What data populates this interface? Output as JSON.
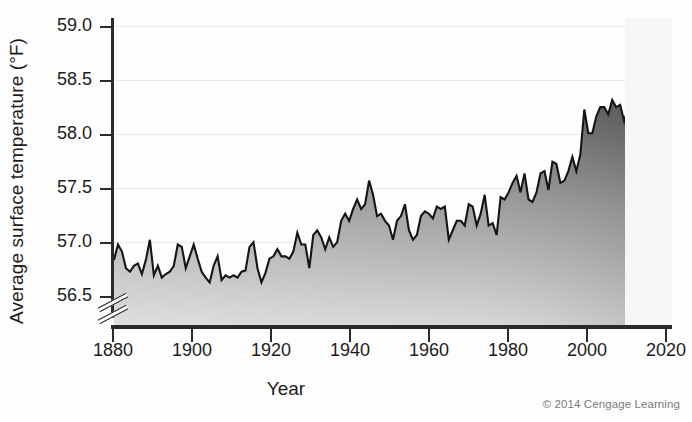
{
  "chart_data": {
    "type": "area",
    "title": "",
    "xlabel": "Year",
    "ylabel": "Average surface temperature (°F)",
    "xlim": [
      1880,
      2020
    ],
    "ylim": [
      56.5,
      59.0
    ],
    "axis_break": true,
    "axis_break_note": "y-axis broken below 56.5",
    "grid": true,
    "legend": null,
    "credit": "© 2014 Cengage Learning",
    "xticks": [
      1880,
      1900,
      1920,
      1940,
      1960,
      1980,
      2000,
      2020
    ],
    "xtick_labels": [
      "1880",
      "1900",
      "1920",
      "1940",
      "1960",
      "1980",
      "2000",
      "2020"
    ],
    "yticks": [
      56.5,
      57.0,
      57.5,
      58.0,
      58.5,
      59.0
    ],
    "ytick_labels": [
      "56.5",
      "57.0",
      "57.5",
      "58.0",
      "58.5",
      "59.0"
    ],
    "series_name": "Average global surface temperature",
    "fill": "gradient-gray",
    "line_color": "#1a1a1a",
    "data_start_year": 1880,
    "data_end_year": 2011,
    "x": [
      1880,
      1881,
      1882,
      1883,
      1884,
      1885,
      1886,
      1887,
      1888,
      1889,
      1890,
      1891,
      1892,
      1893,
      1894,
      1895,
      1896,
      1897,
      1898,
      1899,
      1900,
      1901,
      1902,
      1903,
      1904,
      1905,
      1906,
      1907,
      1908,
      1909,
      1910,
      1911,
      1912,
      1913,
      1914,
      1915,
      1916,
      1917,
      1918,
      1919,
      1920,
      1921,
      1922,
      1923,
      1924,
      1925,
      1926,
      1927,
      1928,
      1929,
      1930,
      1931,
      1932,
      1933,
      1934,
      1935,
      1936,
      1937,
      1938,
      1939,
      1940,
      1941,
      1942,
      1943,
      1944,
      1945,
      1946,
      1947,
      1948,
      1949,
      1950,
      1951,
      1952,
      1953,
      1954,
      1955,
      1956,
      1957,
      1958,
      1959,
      1960,
      1961,
      1962,
      1963,
      1964,
      1965,
      1966,
      1967,
      1968,
      1969,
      1970,
      1971,
      1972,
      1973,
      1974,
      1975,
      1976,
      1977,
      1978,
      1979,
      1980,
      1981,
      1982,
      1983,
      1984,
      1985,
      1986,
      1987,
      1988,
      1989,
      1990,
      1991,
      1992,
      1993,
      1994,
      1995,
      1996,
      1997,
      1998,
      1999,
      2000,
      2001,
      2002,
      2003,
      2004,
      2005,
      2006,
      2007,
      2008,
      2009,
      2010,
      2011
    ],
    "values": [
      57.05,
      57.18,
      57.12,
      56.98,
      56.95,
      57.0,
      57.02,
      56.93,
      57.05,
      57.22,
      56.92,
      57.0,
      56.9,
      56.93,
      56.95,
      57.0,
      57.18,
      57.16,
      56.98,
      57.08,
      57.18,
      57.06,
      56.95,
      56.9,
      56.86,
      57.0,
      57.08,
      56.88,
      56.92,
      56.9,
      56.92,
      56.9,
      56.95,
      56.96,
      57.16,
      57.2,
      56.98,
      56.86,
      56.94,
      57.06,
      57.08,
      57.14,
      57.08,
      57.08,
      57.06,
      57.12,
      57.28,
      57.18,
      57.18,
      56.98,
      57.26,
      57.3,
      57.24,
      57.14,
      57.24,
      57.16,
      57.2,
      57.38,
      57.44,
      57.38,
      57.48,
      57.56,
      57.48,
      57.52,
      57.72,
      57.6,
      57.42,
      57.44,
      57.38,
      57.34,
      57.22,
      57.38,
      57.42,
      57.52,
      57.3,
      57.22,
      57.26,
      57.42,
      57.46,
      57.44,
      57.4,
      57.5,
      57.48,
      57.5,
      57.22,
      57.3,
      57.38,
      57.38,
      57.34,
      57.52,
      57.5,
      57.34,
      57.44,
      57.6,
      57.34,
      57.36,
      57.26,
      57.58,
      57.56,
      57.62,
      57.7,
      57.76,
      57.62,
      57.78,
      57.56,
      57.54,
      57.62,
      57.78,
      57.8,
      57.64,
      57.88,
      57.86,
      57.7,
      57.72,
      57.8,
      57.92,
      57.8,
      57.94,
      58.32,
      58.12,
      58.12,
      58.26,
      58.34,
      58.34,
      58.28,
      58.4,
      58.34,
      58.36,
      58.22,
      58.34,
      58.42,
      58.26
    ]
  },
  "axes": {
    "ytick_labels": [
      "59.0",
      "58.5",
      "58.0",
      "57.5",
      "57.0",
      "56.5"
    ],
    "xtick_labels": [
      "1880",
      "1900",
      "1920",
      "1940",
      "1960",
      "1980",
      "2000",
      "2020"
    ],
    "xlabel": "Year",
    "ylabel": "Average surface temperature (°F)"
  },
  "credit": {
    "text": "© 2014 Cengage Learning"
  }
}
